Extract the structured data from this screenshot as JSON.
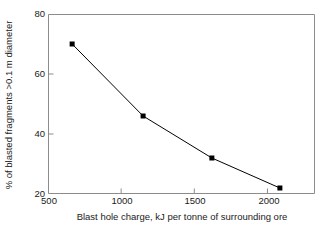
{
  "chart_data": {
    "type": "line",
    "title": "",
    "xlabel": "Blast hole charge, kJ per tonne of surrounding ore",
    "ylabel": "% of blasted fragments >0.1 m diameter",
    "x": [
      665,
      1150,
      1620,
      2085
    ],
    "values": [
      70,
      46,
      32,
      22
    ],
    "series": [
      {
        "name": "blasted fragments >0.1 m",
        "x": [
          665,
          1150,
          1620,
          2085
        ],
        "values": [
          70,
          46,
          32,
          22
        ]
      }
    ],
    "xlim": [
      500,
      2325
    ],
    "ylim": [
      20,
      80
    ],
    "xticks": [
      500,
      1000,
      1500,
      2000
    ],
    "yticks": [
      20,
      40,
      60,
      80
    ],
    "xtick_labels": [
      "500",
      "1000",
      "1500",
      "2000"
    ],
    "ytick_labels": [
      "20",
      "40",
      "60",
      "80"
    ],
    "grid": false,
    "legend": false,
    "legend_position": "none",
    "marker": "filled-square",
    "line_color": "#000000",
    "marker_color": "#000000",
    "axis_color": "#8c8c8c",
    "background": "#ffffff"
  }
}
